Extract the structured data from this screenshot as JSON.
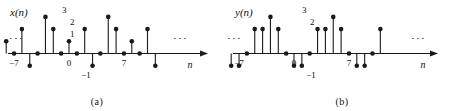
{
  "chart_data": [
    {
      "type": "stem",
      "panel": "a",
      "title": "",
      "ylabel": "x(n)",
      "xlabel": "n",
      "caption": "(a)",
      "x_tick_labels": [
        "-7",
        "0",
        "7"
      ],
      "x_ticks": [
        -7,
        0,
        7
      ],
      "amplitude_labels": [
        "3",
        "2",
        "1",
        "-1"
      ],
      "amplitude_label_values": [
        3,
        2,
        1,
        -1
      ],
      "ylim": [
        -1,
        3
      ],
      "xlim": [
        -11,
        12
      ],
      "grid": false,
      "legend": null,
      "continuation_marks": [
        "...",
        "..."
      ],
      "period": 6,
      "x": [
        -10,
        -9,
        -8,
        -7,
        -6,
        -5,
        -4,
        -3,
        -2,
        -1,
        0,
        1,
        2,
        3,
        4,
        5,
        6,
        7,
        8,
        9,
        10,
        11
      ],
      "values": [
        2,
        0,
        1,
        0,
        2,
        -1,
        0,
        3,
        2,
        0,
        1,
        0,
        2,
        -1,
        0,
        3,
        2,
        0,
        1,
        0,
        2,
        -1
      ]
    },
    {
      "type": "stem",
      "panel": "b",
      "title": "",
      "ylabel": "y(n)",
      "xlabel": "n",
      "caption": "(b)",
      "x_tick_labels": [
        "-7",
        "0",
        "7"
      ],
      "x_ticks": [
        -7,
        0,
        7
      ],
      "amplitude_labels": [
        "3",
        "2",
        "-1"
      ],
      "amplitude_label_values": [
        3,
        2,
        -1
      ],
      "ylim": [
        -1,
        3
      ],
      "xlim": [
        -11,
        12
      ],
      "grid": false,
      "legend": null,
      "continuation_marks": [
        "...",
        "..."
      ],
      "period": 8,
      "x": [
        -10,
        -9,
        -8,
        -7,
        -6,
        -5,
        -4,
        -3,
        -2,
        -1,
        0,
        1,
        2,
        3,
        4,
        5,
        6,
        7,
        8,
        9,
        10,
        11
      ],
      "values": [
        2,
        0,
        -1,
        -1,
        0,
        2,
        2,
        3,
        2,
        0,
        -1,
        -1,
        0,
        2,
        2,
        3,
        2,
        0,
        -1,
        -1,
        0,
        2,
        2
      ]
    }
  ],
  "figures": {
    "a": {
      "ylabel": "x(n)",
      "axis_label": "n",
      "caption": "(a)",
      "tick_minus7": "−7",
      "tick_0": "0",
      "tick_7": "7",
      "amp_3": "3",
      "amp_2": "2",
      "amp_1": "1",
      "amp_minus1": "−1",
      "ellipsis_left": "․․․",
      "ellipsis_right": "․․․"
    },
    "b": {
      "ylabel": "y(n)",
      "axis_label": "n",
      "caption": "(b)",
      "tick_minus7": "−7",
      "tick_0": "0",
      "tick_7": "7",
      "amp_3": "3",
      "amp_2": "2",
      "amp_minus1": "−1",
      "ellipsis_left": "․․․",
      "ellipsis_right": "․․․"
    }
  },
  "colors": {
    "ink": "#1a1a1a",
    "background": "#ffffff"
  }
}
